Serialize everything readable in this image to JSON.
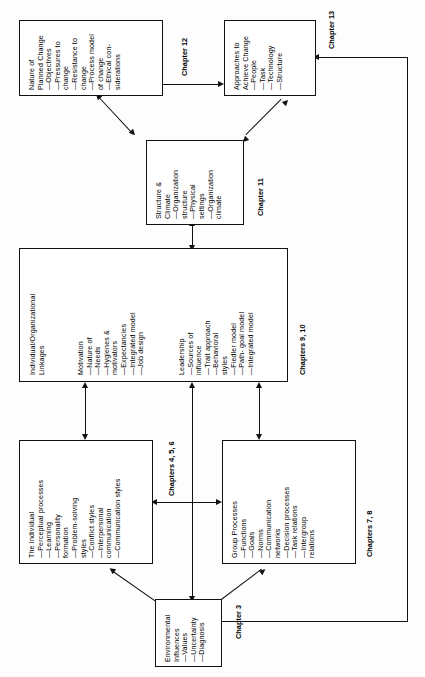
{
  "diagram": {
    "orientation": "rotated-90-ccw",
    "nodes": {
      "nature_of_planned_change": {
        "heading": "Nature of\nPlanned Change",
        "items": [
          "—Objectives",
          "—Pressures to\n   change",
          "—Resistance to\n   change",
          "—Process model\n   of change",
          "—Ethical con-\n   siderations"
        ],
        "full_text": "Nature of\nPlanned Change\n—Objectives\n—Pressures to\nchange\n—Resistance to\nchange\n—Process model\nof change\n—Ethical con-\nsiderations"
      },
      "approaches_to_achieve_change": {
        "heading": "Approaches to\nAchieve Change",
        "items": [
          "—People",
          "—Task",
          "—Technology",
          "—Structure"
        ],
        "full_text": "Approaches to\nAchieve Change\n—People\n—Task\n—Technology\n—Structure"
      },
      "structure_and_climate": {
        "heading": "Structure &\nClimate",
        "items": [
          "—Organization\n   structure",
          "—Physical\n   settings",
          "—Organization\n   climate"
        ],
        "full_text": "Structure &\nClimate\n—Organization\nstructure\n—Physical\nsettings\n—Organization\nclimate"
      },
      "individual_organizational_linkages": {
        "heading": "Individual/Organizational\nLinkages",
        "subsection_motivation": {
          "label": "Motivation",
          "items": [
            "—Nature of",
            "—Needs",
            "—Hygienes &\n   motivators",
            "—Expectancies",
            "—Integrated model",
            "—Job design"
          ],
          "full_text": "Motivation\n—Nature of\n—Needs\n—Hygienes &\nmotivators\n—Expectancies\n—Integrated model\n—Job design"
        },
        "subsection_leadership": {
          "label": "Leadership",
          "items": [
            "—Sources of\n   influence",
            "—Trait approach",
            "—Behavioral\n   styles",
            "—Fiedler model",
            "—Path-goal model",
            "—Integrated model"
          ],
          "full_text": "Leadership\n—Sources of\ninfluence\n—Trait approach\n—Behavioral\nstyles\n—Fiedler model\n—Path- goal model\n—Integrated model"
        }
      },
      "the_individual": {
        "heading": "The Individual",
        "items": [
          "—Perceptual processes",
          "—Learning",
          "—Personality\n   formation",
          "—Problem-solving\n   styles",
          "—Conflict styles",
          "—Interpersonal\n   communication",
          "—Communication styles"
        ],
        "full_text": "The Individual\n—Perceptual processes\n—Learning\n—Personality\nformation\n—Problem-solving\nstyles\n—Conflict styles\n—Interpersonal\ncommunication\n—Communication styles"
      },
      "group_processes": {
        "heading": "Group Processes",
        "items": [
          "—Functions",
          "—Goals",
          "—Norms",
          "—Communication\n   networks",
          "—Decision processes",
          "—Task relations",
          "—Intergroup\n   relations"
        ],
        "full_text": "Group Processes\n—Functions\n—Goals\n—Norms\n—Communication\nnetworks\n—Decision processes\n—Task relations\n—Intergroup\nrelations"
      },
      "environmental_influences": {
        "heading": "Environmental\nInfluences",
        "items": [
          "—Values",
          "—Uncertainty",
          "—Diagnosis"
        ],
        "full_text": "Environmental\nInfluences\n—Values\n—Uncertainty\n—Diagnosis"
      }
    },
    "chapter_labels": {
      "ch12": "Chapter 12",
      "ch13": "Chapter 13",
      "ch11": "Chapter 11",
      "ch9_10": "Chapters 9, 10",
      "ch4_5_6": "Chapters 4, 5, 6",
      "ch7_8": "Chapters 7, 8",
      "ch3": "Chapter 3"
    },
    "colors": {
      "line": "#111111",
      "box_fill": "#ffffff",
      "page_bg": "#fdfdfd",
      "text": "#000000"
    }
  }
}
